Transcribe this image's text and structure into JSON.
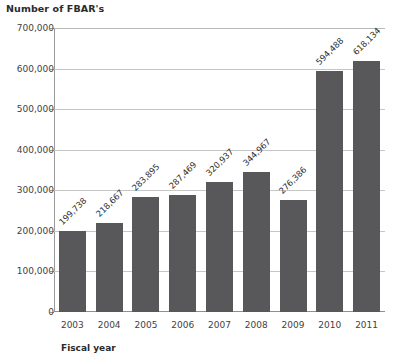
{
  "chart_data": {
    "type": "bar",
    "title": "Number of FBAR's",
    "xlabel": "Fiscal year",
    "ylabel": "",
    "ylim": [
      0,
      700000
    ],
    "grid": true,
    "legend": "none",
    "categories": [
      "2003",
      "2004",
      "2005",
      "2006",
      "2007",
      "2008",
      "2009",
      "2010",
      "2011"
    ],
    "values": [
      199738,
      218667,
      283895,
      287469,
      320937,
      344967,
      276386,
      594488,
      618134
    ],
    "value_labels": [
      "199,738",
      "218,667",
      "283,895",
      "287,469",
      "320,937",
      "344,967",
      "276,386",
      "594,488",
      "618,134"
    ],
    "ytick_labels": [
      "700,000",
      "600,000",
      "500,000",
      "400,000",
      "300,000",
      "200,000",
      "100,000",
      "0"
    ],
    "ytick_values": [
      700000,
      600000,
      500000,
      400000,
      300000,
      200000,
      100000,
      0
    ],
    "bar_color": "#58585a",
    "grid_color": "#c6c6c6",
    "text_color": "#3f3f3f"
  }
}
